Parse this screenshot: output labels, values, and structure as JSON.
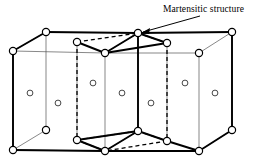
{
  "figure": {
    "kind": "crystal-lattice-diagram",
    "annotation": {
      "label": "Martensitic structure",
      "label_x": 163,
      "label_y": 4,
      "arrow_from": [
        200,
        16
      ],
      "arrow_to": [
        140,
        33
      ]
    },
    "colors": {
      "line": "#000000",
      "thin_line": "#555555",
      "background": "#ffffff",
      "node_fill": "#ffffff"
    },
    "strokes": {
      "bold": 1.9,
      "thin": 0.7,
      "dashed": 1.3,
      "dash_pattern": "4,3"
    },
    "node_radius": 3.6,
    "corner_nodes": [
      {
        "name": "fcc-node-top-back-left",
        "x": 46,
        "y": 32
      },
      {
        "name": "fcc-node-top-back-mid",
        "x": 138,
        "y": 33
      },
      {
        "name": "fcc-node-top-back-right",
        "x": 232,
        "y": 32
      },
      {
        "name": "fcc-node-top-front-left",
        "x": 13,
        "y": 51
      },
      {
        "name": "fcc-node-top-front-mid",
        "x": 105,
        "y": 53
      },
      {
        "name": "fcc-node-top-front-right",
        "x": 199,
        "y": 53
      },
      {
        "name": "fcc-node-bottom-back-left",
        "x": 46,
        "y": 130
      },
      {
        "name": "fcc-node-bottom-back-mid",
        "x": 138,
        "y": 131
      },
      {
        "name": "fcc-node-bottom-back-right",
        "x": 232,
        "y": 130
      },
      {
        "name": "fcc-node-bottom-front-left",
        "x": 13,
        "y": 150
      },
      {
        "name": "fcc-node-bottom-front-mid",
        "x": 105,
        "y": 151
      },
      {
        "name": "fcc-node-bottom-front-right",
        "x": 199,
        "y": 151
      },
      {
        "name": "bct-node-top-back-left",
        "x": 77,
        "y": 42
      },
      {
        "name": "bct-node-top-back-right",
        "x": 167,
        "y": 43
      },
      {
        "name": "bct-node-bottom-back-left",
        "x": 77,
        "y": 140
      },
      {
        "name": "bct-node-bottom-back-right",
        "x": 167,
        "y": 141
      }
    ],
    "face_center_atoms": [
      {
        "name": "face-atom-1",
        "x": 30,
        "y": 93
      },
      {
        "name": "face-atom-2",
        "x": 58,
        "y": 103
      },
      {
        "name": "face-atom-3",
        "x": 93,
        "y": 83
      },
      {
        "name": "face-atom-4",
        "x": 122,
        "y": 93
      },
      {
        "name": "face-atom-5",
        "x": 151,
        "y": 103
      },
      {
        "name": "face-atom-6",
        "x": 185,
        "y": 83
      },
      {
        "name": "face-atom-7",
        "x": 215,
        "y": 93
      }
    ]
  }
}
